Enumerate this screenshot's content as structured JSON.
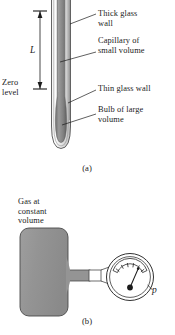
{
  "figure": {
    "background_color": "#ffffff",
    "ink_color": "#1b1b1b",
    "fill_gray": "#8a8a8a",
    "glass_gray": "#c9c9c9"
  },
  "panel_a": {
    "caption": "(a)",
    "labels": {
      "thick_glass_wall": "Thick glass\nwall",
      "capillary": "Capillary of\nsmall volume",
      "thin_glass_wall": "Thin glass wall",
      "bulb": "Bulb of large\nvolume",
      "zero_level": "Zero\nlevel",
      "length_symbol": "L"
    },
    "leader_lines": [
      {
        "name": "leader-thick-glass-wall",
        "from": [
          62,
          24
        ],
        "to": [
          95,
          14
        ]
      },
      {
        "name": "leader-capillary",
        "from": [
          62,
          60
        ],
        "to": [
          95,
          51
        ]
      },
      {
        "name": "leader-thin-glass-wall",
        "from": [
          66,
          102
        ],
        "to": [
          95,
          90
        ]
      },
      {
        "name": "leader-bulb",
        "from": [
          62,
          123
        ],
        "to": [
          95,
          115
        ]
      }
    ],
    "dimension": {
      "name": "length-L",
      "x": 40,
      "top_y": 10,
      "bottom_y": 90,
      "tick_half_width": 7
    },
    "tube": {
      "x_left": 52,
      "x_right": 70,
      "top_y": 0,
      "bottom_y": 148
    }
  },
  "panel_b": {
    "caption": "(b)",
    "labels": {
      "gas_at_constant_volume": "Gas at\nconstant\nvolume",
      "pressure_symbol": "p"
    },
    "vessel": {
      "name": "gas-vessel",
      "x": 20,
      "y": 228,
      "width": 48,
      "height": 88,
      "corner_radius": 9
    },
    "connector": {
      "name": "connector-tube",
      "x": 68,
      "y": 270,
      "width": 40,
      "height": 11,
      "white_segment_x": 88,
      "white_segment_width": 12
    },
    "gauge": {
      "name": "pressure-gauge",
      "center_x": 130,
      "center_y": 277,
      "radius": 24,
      "dial_tick_count": 6,
      "needle_angle_deg": -55
    }
  }
}
